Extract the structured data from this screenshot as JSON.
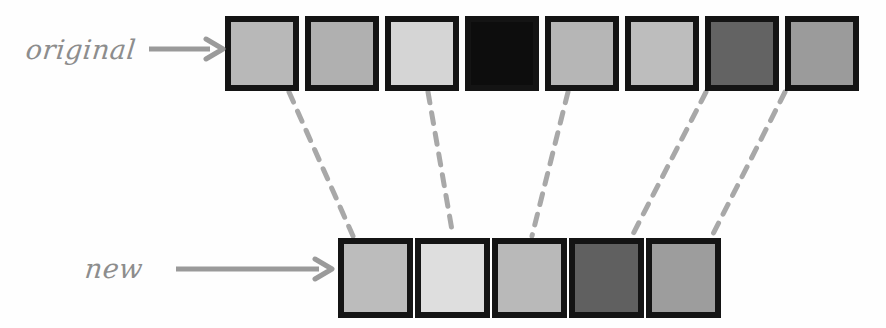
{
  "figure": {
    "type": "diagram",
    "background_color": "#fefefe"
  },
  "rows": [
    {
      "id": "original",
      "label": "original",
      "arrow": {
        "name": "right-arrow",
        "color": "#9a9a9a"
      },
      "tile_count": 8,
      "tiles": [
        {
          "index": 1,
          "fill": "#b8b8b8",
          "border": "#141414"
        },
        {
          "index": 2,
          "fill": "#b0b0b0",
          "border": "#141414"
        },
        {
          "index": 3,
          "fill": "#d5d5d5",
          "border": "#141414"
        },
        {
          "index": 4,
          "fill": "#0d0d0d",
          "border": "#141414"
        },
        {
          "index": 5,
          "fill": "#b6b6b6",
          "border": "#141414"
        },
        {
          "index": 6,
          "fill": "#bdbdbd",
          "border": "#141414"
        },
        {
          "index": 7,
          "fill": "#636363",
          "border": "#141414"
        },
        {
          "index": 8,
          "fill": "#9b9b9b",
          "border": "#141414"
        }
      ]
    },
    {
      "id": "new",
      "label": "new",
      "arrow": {
        "name": "right-arrow",
        "color": "#9a9a9a"
      },
      "tile_count": 5,
      "tiles": [
        {
          "index": 1,
          "fill": "#bcbcbc",
          "border": "#141414"
        },
        {
          "index": 2,
          "fill": "#dedede",
          "border": "#141414"
        },
        {
          "index": 3,
          "fill": "#b9b9b9",
          "border": "#141414"
        },
        {
          "index": 4,
          "fill": "#606060",
          "border": "#141414"
        },
        {
          "index": 5,
          "fill": "#9d9d9d",
          "border": "#141414"
        }
      ]
    }
  ],
  "connectors": {
    "style": "dashed",
    "color": "#a8a8a8",
    "width": 5,
    "dash_pattern": "11 10",
    "links": [
      {
        "from_tile": 1,
        "to_tile": 1,
        "x1": 289,
        "y1": 92,
        "x2": 353,
        "y2": 236
      },
      {
        "from_tile": 3,
        "to_tile": 2,
        "x1": 428,
        "y1": 92,
        "x2": 453,
        "y2": 236
      },
      {
        "from_tile": 5,
        "to_tile": 3,
        "x1": 568,
        "y1": 92,
        "x2": 532,
        "y2": 236
      },
      {
        "from_tile": 7,
        "to_tile": 4,
        "x1": 706,
        "y1": 92,
        "x2": 632,
        "y2": 236
      },
      {
        "from_tile": 8,
        "to_tile": 5,
        "x1": 785,
        "y1": 92,
        "x2": 712,
        "y2": 236
      }
    ]
  }
}
